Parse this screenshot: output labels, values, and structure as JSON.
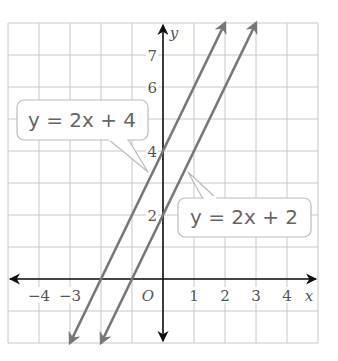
{
  "chart_data": {
    "type": "line",
    "title": "",
    "xlabel": "x",
    "ylabel": "y",
    "origin_label": "O",
    "xlim": [
      -5,
      5
    ],
    "ylim": [
      -2,
      8
    ],
    "grid": true,
    "x_ticks": [
      {
        "value": -4,
        "label": "−4"
      },
      {
        "value": -3,
        "label": "−3"
      },
      {
        "value": 1,
        "label": "1"
      },
      {
        "value": 2,
        "label": "2"
      },
      {
        "value": 3,
        "label": "3"
      },
      {
        "value": 4,
        "label": "4"
      }
    ],
    "y_ticks": [
      {
        "value": 2,
        "label": "2"
      },
      {
        "value": 4,
        "label": "4"
      },
      {
        "value": 6,
        "label": "6"
      },
      {
        "value": 7,
        "label": "7"
      }
    ],
    "series": [
      {
        "name": "y = 2x + 4",
        "slope": 2,
        "intercept": 4,
        "x": [
          -3,
          2
        ],
        "y": [
          -2,
          8
        ],
        "color": "#777777"
      },
      {
        "name": "y = 2x + 2",
        "slope": 2,
        "intercept": 2,
        "x": [
          -2,
          3
        ],
        "y": [
          -2,
          8
        ],
        "color": "#777777"
      }
    ],
    "annotations": [
      {
        "text": "y = 2x + 4",
        "points_to": "series 0"
      },
      {
        "text": "y = 2x + 2",
        "points_to": "series 1"
      }
    ]
  },
  "colors": {
    "grid": "#c8c8c8",
    "axis": "#111111",
    "line": "#777777",
    "callout_border": "#bbbbbb"
  }
}
